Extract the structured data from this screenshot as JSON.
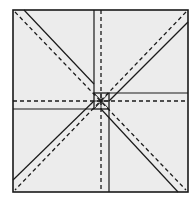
{
  "diagram": {
    "type": "origami-crease-pattern",
    "title": "",
    "colors": {
      "background": "#ffffff",
      "paper": "#ececec",
      "line": "#1a1a1a"
    },
    "paper": {
      "x1": 13,
      "y1": 10,
      "x2": 188,
      "y2": 192
    },
    "center": {
      "x": 101,
      "y": 101
    },
    "center_box": {
      "x": 94,
      "y": 93,
      "w": 15,
      "h": 16
    },
    "solid_lines": [
      {
        "name": "vertical-left-solid",
        "x1": 94,
        "y1": 10,
        "x2": 94,
        "y2": 93
      },
      {
        "name": "vertical-right-solid",
        "x1": 109,
        "y1": 109,
        "x2": 109,
        "y2": 192
      },
      {
        "name": "horizontal-top-solid",
        "x1": 109,
        "y1": 93,
        "x2": 188,
        "y2": 93
      },
      {
        "name": "horizontal-bottom-solid",
        "x1": 13,
        "y1": 109,
        "x2": 94,
        "y2": 109
      },
      {
        "name": "diagonal-tl-solid",
        "x1": 24,
        "y1": 10,
        "x2": 94,
        "y2": 84
      },
      {
        "name": "diagonal-tr-solid",
        "x1": 188,
        "y1": 22,
        "x2": 109,
        "y2": 101
      },
      {
        "name": "diagonal-bl-solid",
        "x1": 13,
        "y1": 180,
        "x2": 94,
        "y2": 101
      },
      {
        "name": "diagonal-br-solid",
        "x1": 101,
        "y1": 109,
        "x2": 178,
        "y2": 192
      }
    ],
    "dashed_lines": [
      {
        "name": "vertical-center-dashed",
        "x1": 101,
        "y1": 10,
        "x2": 101,
        "y2": 192
      },
      {
        "name": "horizontal-center-dashed",
        "x1": 13,
        "y1": 101,
        "x2": 188,
        "y2": 101
      },
      {
        "name": "diagonal-main-dashed",
        "x1": 15,
        "y1": 12,
        "x2": 186,
        "y2": 190
      },
      {
        "name": "diagonal-anti-dashed",
        "x1": 186,
        "y1": 12,
        "x2": 15,
        "y2": 190
      }
    ],
    "legend": {
      "solid": "valley/edge fold",
      "dashed": "mountain fold"
    }
  }
}
